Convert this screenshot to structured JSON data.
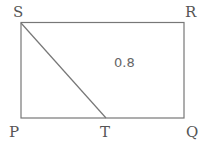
{
  "diagram": {
    "shape": "rectangle",
    "vertices": {
      "S": {
        "label": "S",
        "x": 21,
        "y": 23
      },
      "R": {
        "label": "R",
        "x": 184,
        "y": 22
      },
      "Q": {
        "label": "Q",
        "x": 184,
        "y": 117
      },
      "P": {
        "label": "P",
        "x": 21,
        "y": 118
      },
      "T": {
        "label": "T",
        "x": 106,
        "y": 118
      }
    },
    "segments": [
      {
        "from": "S",
        "to": "R"
      },
      {
        "from": "R",
        "to": "Q"
      },
      {
        "from": "Q",
        "to": "P"
      },
      {
        "from": "P",
        "to": "S"
      },
      {
        "from": "S",
        "to": "T"
      }
    ],
    "region_label": "0.8",
    "colors": {
      "stroke": "#777777",
      "text": "#555555"
    }
  }
}
